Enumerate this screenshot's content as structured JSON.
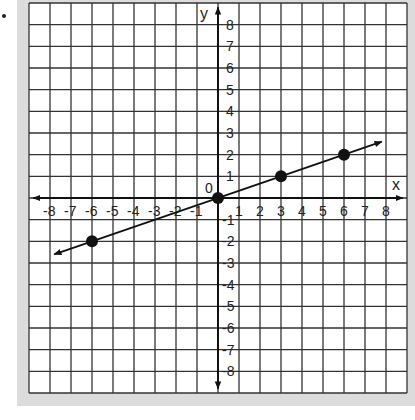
{
  "chart_data": {
    "type": "scatter",
    "title": "",
    "xlabel": "x",
    "ylabel": "y",
    "origin_label": "0",
    "xlim": [
      -9,
      9
    ],
    "ylim": [
      -9,
      9
    ],
    "grid": true,
    "x_ticks": [
      -8,
      -7,
      -6,
      -5,
      -4,
      -3,
      -2,
      -1,
      1,
      2,
      3,
      4,
      5,
      6,
      7,
      8
    ],
    "y_ticks": [
      8,
      7,
      6,
      5,
      4,
      3,
      2,
      1,
      -1,
      -2,
      -3,
      -4,
      -5,
      -6,
      -7,
      -8
    ],
    "points": [
      {
        "x": -6,
        "y": -2
      },
      {
        "x": 0,
        "y": 0
      },
      {
        "x": 3,
        "y": 1
      },
      {
        "x": 6,
        "y": 2
      }
    ],
    "line": {
      "slope": 0.3333,
      "intercept": 0,
      "x_from": -7.8,
      "x_to": 7.8,
      "arrows": "both"
    }
  },
  "colors": {
    "grid": "#333333",
    "axis": "#111111",
    "panel": "#dcdcdc",
    "plot_bg": "#ffffff",
    "point": "#111111"
  }
}
